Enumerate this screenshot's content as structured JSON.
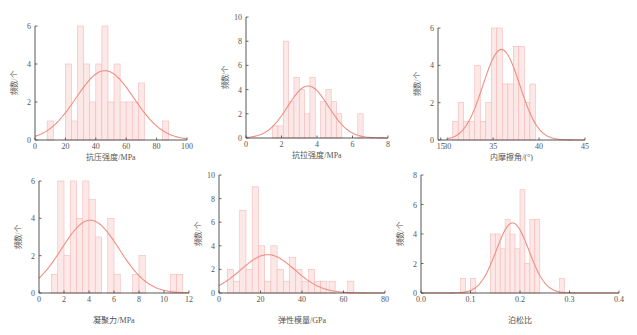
{
  "colors": {
    "bar_fill": "#fde8e8",
    "bar_stroke": "#f4b8b8",
    "curve": "#ef8f80",
    "axis": "#444444"
  },
  "chart_data": [
    {
      "id": "ucs",
      "type": "bar",
      "subtype": "histogram_with_normal_fit",
      "xlabel": "抗压强度/MPa",
      "ylabel": "频数/个",
      "xlim": [
        0,
        100
      ],
      "ylim": [
        0,
        6
      ],
      "xticks": [
        "0",
        "20",
        "40",
        "60",
        "80",
        "100"
      ],
      "xtick_values": [
        0,
        20,
        40,
        60,
        80,
        100
      ],
      "yticks": [
        "0",
        "2",
        "4",
        "6"
      ],
      "ytick_values": [
        0,
        2,
        4,
        6
      ],
      "bin_width": 4,
      "bins": [
        [
          8,
          1
        ],
        [
          20,
          4
        ],
        [
          24,
          1
        ],
        [
          28,
          6
        ],
        [
          32,
          4
        ],
        [
          36,
          2
        ],
        [
          40,
          4
        ],
        [
          44,
          6
        ],
        [
          48,
          2
        ],
        [
          52,
          4
        ],
        [
          56,
          2
        ],
        [
          60,
          2
        ],
        [
          64,
          2
        ],
        [
          68,
          3
        ],
        [
          84,
          1
        ]
      ],
      "fit": {
        "mean": 46,
        "sd": 19,
        "peak": 3.65
      },
      "frame": {
        "x0": 35,
        "x1": 187,
        "y0": 140,
        "y1": 26
      }
    },
    {
      "id": "tensile",
      "type": "bar",
      "subtype": "histogram_with_normal_fit",
      "xlabel": "抗拉强度/MPa",
      "ylabel": "频数/个",
      "xlim": [
        0,
        8
      ],
      "ylim": [
        0,
        10
      ],
      "xticks": [
        "0",
        "2",
        "4",
        "6",
        "8"
      ],
      "xtick_values": [
        0,
        2,
        4,
        6,
        8
      ],
      "yticks": [
        "0",
        "2",
        "4",
        "6",
        "8",
        "10"
      ],
      "ytick_values": [
        0,
        2,
        4,
        6,
        8,
        10
      ],
      "bin_width": 0.3,
      "bins": [
        [
          1.5,
          1
        ],
        [
          1.8,
          1
        ],
        [
          2.1,
          8
        ],
        [
          2.4,
          3
        ],
        [
          2.7,
          5
        ],
        [
          3.0,
          4
        ],
        [
          3.3,
          2
        ],
        [
          3.6,
          5
        ],
        [
          4.2,
          3
        ],
        [
          4.5,
          4
        ],
        [
          4.8,
          3
        ],
        [
          5.1,
          2
        ],
        [
          6.3,
          2
        ]
      ],
      "fit": {
        "mean": 3.5,
        "sd": 1.15,
        "peak": 4.3
      },
      "frame": {
        "x0": 246,
        "x1": 388,
        "y0": 138,
        "y1": 17
      }
    },
    {
      "id": "friction",
      "type": "bar",
      "subtype": "histogram_with_normal_fit",
      "xlabel": "内摩擦角/(°)",
      "ylabel": "频数/个",
      "xlim": [
        29,
        45
      ],
      "ylim": [
        0,
        6
      ],
      "xticks": [
        "15",
        "30",
        "35",
        "40",
        "45"
      ],
      "xtick_values": [
        29.3,
        30,
        35,
        40,
        45
      ],
      "yticks": [
        "0",
        "2",
        "4",
        "6"
      ],
      "ytick_values": [
        0,
        2,
        4,
        6
      ],
      "axis_break": true,
      "bin_width": 0.6,
      "bins": [
        [
          30.6,
          1
        ],
        [
          31.2,
          2
        ],
        [
          31.8,
          1
        ],
        [
          32.4,
          1
        ],
        [
          33.0,
          4
        ],
        [
          33.6,
          1
        ],
        [
          34.2,
          2
        ],
        [
          34.8,
          6
        ],
        [
          35.4,
          6
        ],
        [
          36.0,
          3
        ],
        [
          36.6,
          3
        ],
        [
          37.2,
          5
        ],
        [
          37.8,
          5
        ],
        [
          38.4,
          2
        ],
        [
          39.0,
          3
        ]
      ],
      "fit": {
        "mean": 35.9,
        "sd": 2.0,
        "peak": 4.85
      },
      "frame": {
        "x0": 438,
        "x1": 585,
        "y0": 140,
        "y1": 28
      }
    },
    {
      "id": "cohesion",
      "type": "bar",
      "subtype": "histogram_with_normal_fit",
      "xlabel": "凝聚力/MPa",
      "ylabel": "频数/个",
      "xlim": [
        0,
        12
      ],
      "ylim": [
        0,
        6
      ],
      "xticks": [
        "0",
        "2",
        "4",
        "6",
        "8",
        "10",
        "12"
      ],
      "xtick_values": [
        0,
        2,
        4,
        6,
        8,
        10,
        12
      ],
      "yticks": [
        "0",
        "2",
        "4",
        "6"
      ],
      "ytick_values": [
        0,
        2,
        4,
        6
      ],
      "bin_width": 0.5,
      "bins": [
        [
          1.0,
          1
        ],
        [
          1.5,
          6
        ],
        [
          2.0,
          2
        ],
        [
          2.5,
          6
        ],
        [
          3.0,
          4
        ],
        [
          3.5,
          6
        ],
        [
          4.0,
          5
        ],
        [
          4.5,
          3
        ],
        [
          5.5,
          4
        ],
        [
          6.0,
          1
        ],
        [
          7.5,
          1
        ],
        [
          8.0,
          2
        ],
        [
          10.5,
          1
        ],
        [
          11.0,
          1
        ]
      ],
      "fit": {
        "mean": 4.1,
        "sd": 2.3,
        "peak": 3.9
      },
      "frame": {
        "x0": 39,
        "x1": 189,
        "y0": 293,
        "y1": 181
      }
    },
    {
      "id": "modulus",
      "type": "bar",
      "subtype": "histogram_with_normal_fit",
      "xlabel": "弹性模量/GPa",
      "ylabel": "频数/个",
      "xlim": [
        0,
        80
      ],
      "ylim": [
        0,
        10
      ],
      "xticks": [
        "0",
        "20",
        "40",
        "60",
        "80"
      ],
      "xtick_values": [
        0,
        20,
        40,
        60,
        80
      ],
      "yticks": [
        "0",
        "2",
        "4",
        "6",
        "8",
        "10"
      ],
      "ytick_values": [
        0,
        2,
        4,
        6,
        8,
        10
      ],
      "bin_width": 3,
      "bins": [
        [
          4,
          2
        ],
        [
          7,
          1
        ],
        [
          10,
          7
        ],
        [
          13,
          2
        ],
        [
          16,
          9
        ],
        [
          19,
          4
        ],
        [
          22,
          1
        ],
        [
          25,
          4
        ],
        [
          28,
          2
        ],
        [
          31,
          1
        ],
        [
          34,
          3
        ],
        [
          37,
          2
        ],
        [
          40,
          1
        ],
        [
          43,
          2
        ],
        [
          46,
          1
        ],
        [
          49,
          1
        ],
        [
          53,
          1
        ],
        [
          62,
          1
        ]
      ],
      "fit": {
        "mean": 23.5,
        "sd": 13,
        "peak": 3.25
      },
      "frame": {
        "x0": 219,
        "x1": 385,
        "y0": 293,
        "y1": 175
      }
    },
    {
      "id": "poisson",
      "type": "bar",
      "subtype": "histogram_with_normal_fit",
      "xlabel": "泊松比",
      "ylabel": "频数/个",
      "xlim": [
        0,
        0.4
      ],
      "ylim": [
        0,
        8
      ],
      "xticks": [
        "0.0",
        "0.1",
        "0.2",
        "0.3",
        "0.4"
      ],
      "xtick_values": [
        0,
        0.1,
        0.2,
        0.3,
        0.4
      ],
      "yticks": [
        "0",
        "2",
        "4",
        "6",
        "8"
      ],
      "ytick_values": [
        0,
        2,
        4,
        6,
        8
      ],
      "bin_width": 0.01,
      "bins": [
        [
          0.08,
          1
        ],
        [
          0.1,
          1
        ],
        [
          0.14,
          4
        ],
        [
          0.15,
          4
        ],
        [
          0.16,
          3
        ],
        [
          0.17,
          5
        ],
        [
          0.18,
          4
        ],
        [
          0.19,
          3
        ],
        [
          0.2,
          7
        ],
        [
          0.21,
          2
        ],
        [
          0.22,
          5
        ],
        [
          0.23,
          5
        ],
        [
          0.28,
          1
        ]
      ],
      "fit": {
        "mean": 0.185,
        "sd": 0.033,
        "peak": 4.75
      },
      "frame": {
        "x0": 421,
        "x1": 619,
        "y0": 293,
        "y1": 175
      }
    }
  ]
}
